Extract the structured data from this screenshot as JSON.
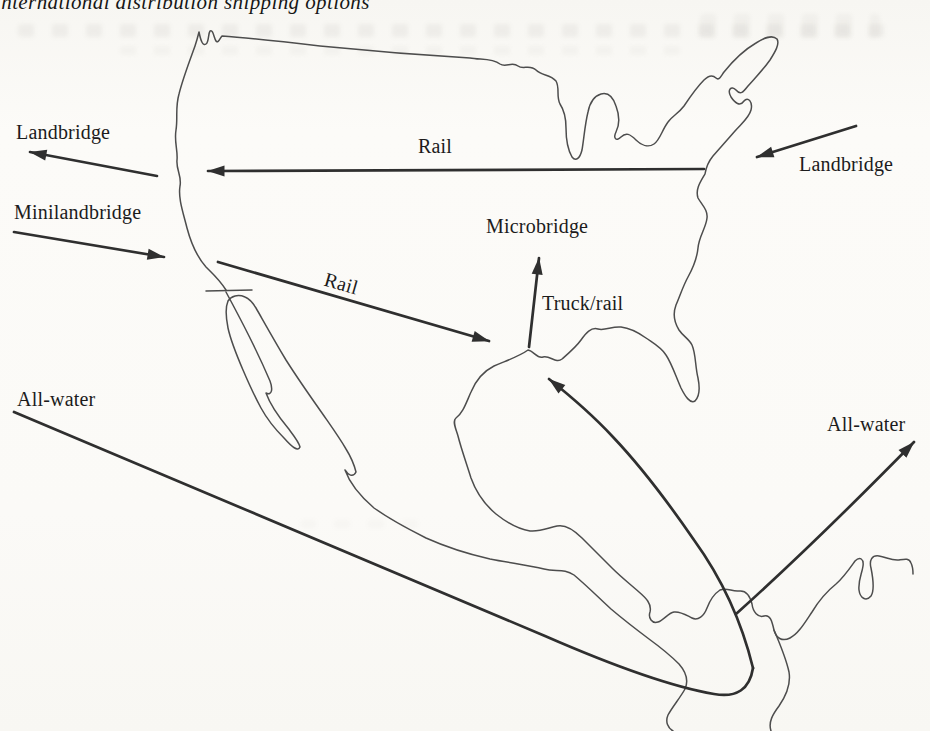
{
  "figure": {
    "caption": "international distribution shipping options",
    "region": "North America outline map (USA, Mexico, Central America)"
  },
  "labels": {
    "landbridge_west": "Landbridge",
    "minilandbridge": "Minilandbridge",
    "rail_main": "Rail",
    "rail_southern": "Rail",
    "microbridge": "Microbridge",
    "truck_rail": "Truck/rail",
    "landbridge_east": "Landbridge",
    "all_water_west": "All-water",
    "all_water_east": "All-water"
  },
  "colors": {
    "paper": "#fbfaf7",
    "coastline": "#4d4d4d",
    "arrow": "#2f2f2f",
    "text": "#1c1c1c"
  }
}
